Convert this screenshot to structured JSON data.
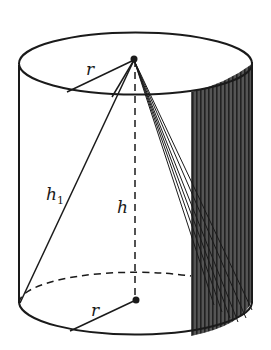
{
  "figure": {
    "type": "cylinder-with-inscribed-cone",
    "colors": {
      "stroke": "#1a1a1a",
      "shade": "#4a4a4a",
      "background": "#ffffff"
    },
    "labels": {
      "top_radius": "r",
      "slant_height": "h",
      "slant_height_sub": "1",
      "height": "h",
      "bottom_radius": "r"
    }
  }
}
